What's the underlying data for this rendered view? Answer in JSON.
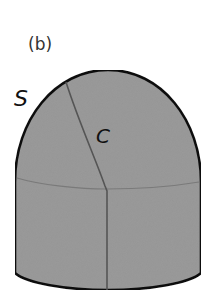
{
  "figure": {
    "panel_label": "(b)",
    "surface_label": "S",
    "curve_label": "C",
    "colors": {
      "surface_fill": "#9a9a9a",
      "outline": "#111111",
      "curve": "#555555",
      "seam": "#7a7a7a",
      "background": "#ffffff"
    }
  }
}
